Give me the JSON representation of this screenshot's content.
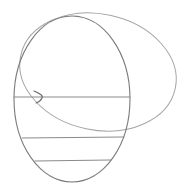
{
  "drawing": {
    "description": "Pencil sketch of two overlapping ellipses with horizontal lines and an arrowhead",
    "stroke_color": "#8a8a8a",
    "stroke_color_dark": "#6e6e6e",
    "background": "#ffffff",
    "shapes": {
      "left_ellipse": {
        "cx": 72,
        "cy": 99,
        "rx": 58,
        "ry": 83
      },
      "right_ellipse": {
        "cx": 98,
        "cy": 72,
        "rx": 79,
        "ry": 58,
        "rotate": 12
      },
      "lines": [
        {
          "x1": 14,
          "y1": 97,
          "x2": 130,
          "y2": 97
        },
        {
          "x1": 22,
          "y1": 138,
          "x2": 124,
          "y2": 137
        },
        {
          "x1": 35,
          "y1": 161,
          "x2": 111,
          "y2": 160
        }
      ],
      "arrowhead": "M34 91 Q44 95 42 98 Q40 102 36 103"
    }
  }
}
